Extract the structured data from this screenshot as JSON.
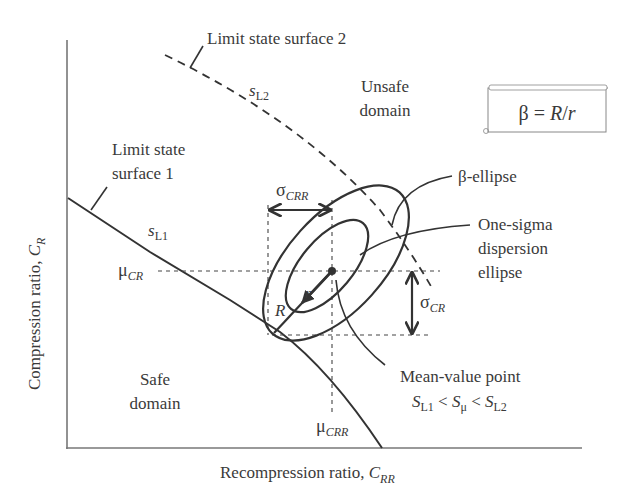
{
  "diagram": {
    "axes": {
      "x_label": "Recompression ratio, ",
      "x_label_var": "C",
      "x_label_sub": "RR",
      "y_label": "Compression ratio, ",
      "y_label_var": "C",
      "y_label_sub": "R"
    },
    "curves": {
      "limit_surface_1": {
        "label_line1": "Limit state",
        "label_line2": "surface 1",
        "symbol": "s",
        "symbol_sub": "L1"
      },
      "limit_surface_2": {
        "label": "Limit state surface 2",
        "symbol": "s",
        "symbol_sub": "L2"
      }
    },
    "regions": {
      "unsafe": {
        "line1": "Unsafe",
        "line2": "domain"
      },
      "safe": {
        "line1": "Safe",
        "line2": "domain"
      }
    },
    "formula_box": {
      "beta": "β",
      "equals": " = ",
      "R": "R",
      "slash": "/",
      "r": "r"
    },
    "annotations": {
      "beta_ellipse": "β-ellipse",
      "one_sigma_line1": "One-sigma",
      "one_sigma_line2": "dispersion",
      "one_sigma_line3": "ellipse",
      "mean_point_line1": "Mean-value point",
      "mean_ineq": {
        "s1": "S",
        "s1_sub": "L1",
        "lt1": " < ",
        "s2": "S",
        "s2_sub": "μ",
        "lt2": " < ",
        "s3": "S",
        "s3_sub": "L2"
      }
    },
    "symbols": {
      "mu_cr": "μ",
      "mu_cr_sub": "CR",
      "mu_crr": "μ",
      "mu_crr_sub": "CRR",
      "sigma_crr": "σ",
      "sigma_crr_sub": "CRR",
      "sigma_cr": "σ",
      "sigma_cr_sub": "CR",
      "R": "R",
      "r": "r"
    },
    "colors": {
      "line": "#333333",
      "text": "#3a3a3a",
      "axis": "#777777"
    }
  }
}
